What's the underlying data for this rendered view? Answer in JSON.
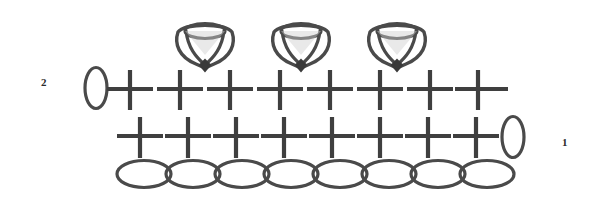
{
  "diagram": {
    "type": "crochet-pattern-chart",
    "background_color": "#ffffff",
    "stroke_color": "#4a4a4a",
    "stroke_color_dark": "#3a3a3a",
    "labels": {
      "row1": "1",
      "row2": "2"
    },
    "legend_keys": {
      "oval": "chain-stitch",
      "cross": "single-crochet-stitch",
      "puff": "puff-stitch"
    },
    "rows": [
      {
        "name": "foundation-chain",
        "row_number": "",
        "symbol": "chain-stitch",
        "count": 8,
        "y": 174,
        "start_x": 138,
        "spacing": 49,
        "rx": 26,
        "ry": 13
      },
      {
        "name": "row-1",
        "row_number": "1",
        "symbol": "single-crochet-stitch",
        "count": 8,
        "y_bar_top": 118,
        "y_bar_bottom": 158,
        "y_cross": 136,
        "start_x": 140,
        "spacing": 48,
        "bar_half_width": 23,
        "turning_chain": {
          "name": "turning-chain-row-1",
          "symbol": "chain-stitch",
          "cx": 513,
          "cy": 137,
          "rx": 11,
          "ry": 20
        }
      },
      {
        "name": "row-2",
        "row_number": "2",
        "symbol": "single-crochet-stitch",
        "count": 8,
        "y_bar_top": 70,
        "y_bar_bottom": 110,
        "y_cross": 89,
        "start_x": 130,
        "spacing": 50,
        "bar_half_width": 24,
        "turning_chain": {
          "name": "turning-chain-row-2",
          "symbol": "chain-stitch",
          "cx": 96,
          "cy": 88,
          "rx": 11,
          "ry": 20
        }
      },
      {
        "name": "puff-stitch-row",
        "symbol": "puff-stitch",
        "count": 3,
        "positions_x": [
          205,
          301,
          397
        ],
        "tip_y": 71,
        "top_y": 26,
        "width": 56,
        "height": 45
      }
    ]
  }
}
